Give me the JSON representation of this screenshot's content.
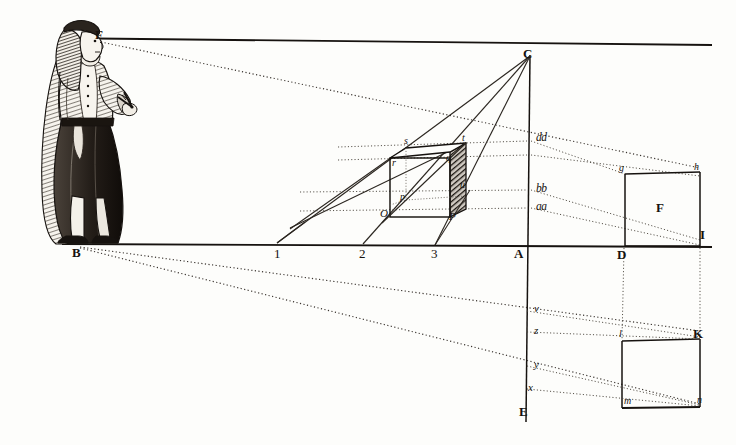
{
  "plate": {
    "title": "Perspective construction with observer",
    "background_color": "#fdfdfb",
    "ink_color": "#16120f",
    "width": 736,
    "height": 445
  },
  "figure": {
    "name": "standing-observer",
    "eye_label": "F",
    "foot_label": "B"
  },
  "labels": {
    "eye_point": "F",
    "foot_point": "B",
    "vanishing_point": "C",
    "ground_point_A": "A",
    "ground_point_D": "D",
    "ground_point_I": "I",
    "baseline_1": "1",
    "baseline_2": "2",
    "baseline_3": "3",
    "cube_front_bottom_left": "O",
    "cube_front_bottom_right": "P",
    "cube_front_top_left": "r",
    "cube_front_top_right": "q",
    "cube_back_top_left": "s",
    "cube_back_top_right": "t",
    "cube_back_bottom": "p",
    "cube_side_point": "u",
    "measure_aa": "aa",
    "measure_bb": "bb",
    "measure_dd": "dd",
    "square_top_left": "g",
    "square_top_right": "h",
    "square_center": "F",
    "axis_v": "v",
    "axis_z": "z",
    "axis_y": "y",
    "axis_x": "x",
    "axis_bottom": "E",
    "lower_square_top_left": "l",
    "lower_square_top_right": "K",
    "lower_square_bottom_left": "m",
    "lower_square_bottom_right": "n"
  },
  "colors": {
    "ink": "#16120f",
    "shade": "#2a241e",
    "dotted": "#4a443c",
    "paper": "#fdfdfb"
  }
}
